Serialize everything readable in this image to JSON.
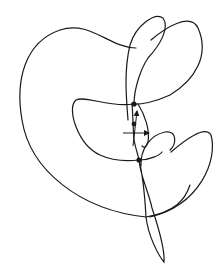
{
  "diagram": {
    "background": "#ffffff",
    "stroke_color": "#1a1a1a",
    "stroke_width": 1.2,
    "curve_segments": [
      {
        "id": "outer-lobe",
        "d": "M 136 48 C 110 48, 90 20, 60 30 C 25 42, 15 80, 22 120 C 30 170, 80 210, 146 217 C 175 212, 185 200, 190 185"
      },
      {
        "id": "upper-right-petal",
        "d": "M 151 40 C 165 28, 190 12, 198 28 C 210 55, 195 80, 170 95 C 155 102, 140 105, 132 104"
      },
      {
        "id": "upper-left-petal",
        "d": "M 128 120 C 126 95, 124 70, 130 45 C 136 25, 155 12, 163 18 C 170 28, 160 45, 148 58 C 140 70, 134 90, 134 104"
      },
      {
        "id": "middle-band",
        "d": "M 133 104 C 110 108, 85 95, 76 100 C 66 108, 78 145, 100 155 C 115 162, 130 161, 139 160 C 150 160, 160 155, 162 152"
      },
      {
        "id": "lower-inner-loop",
        "d": "M 138 104 C 145 115, 150 130, 148 142 C 146 148, 144 148, 142 146"
      },
      {
        "id": "lower-right-petal",
        "d": "M 141 166 C 140 150, 150 135, 165 132 C 178 130, 176 145, 170 150 M 171 152 C 185 140, 205 125, 211 135 C 218 160, 200 205, 150 217"
      },
      {
        "id": "bottom-tail",
        "d": "M 139 160 C 144 180, 145 200, 146 217 C 148 235, 158 255, 164 262 C 165 250, 160 232, 152 208 C 148 190, 140 175, 139 160"
      },
      {
        "id": "center-spine",
        "d": "M 132 104 C 133 115, 133 130, 134 140 C 136 150, 138 155, 139 160"
      }
    ],
    "nodes": [
      {
        "id": "node-top",
        "cx": 134,
        "cy": 104,
        "r": 2.6
      },
      {
        "id": "node-middle",
        "cx": 134,
        "cy": 124,
        "r": 2.4
      },
      {
        "id": "node-bottom",
        "cx": 139,
        "cy": 160,
        "r": 2.6
      }
    ],
    "axes_marker": {
      "horizontal": {
        "x1": 123,
        "y1": 133,
        "x2": 149,
        "y2": 133
      },
      "vertical": {
        "x1": 133,
        "y1": 146,
        "x2": 137,
        "y2": 111
      }
    }
  }
}
